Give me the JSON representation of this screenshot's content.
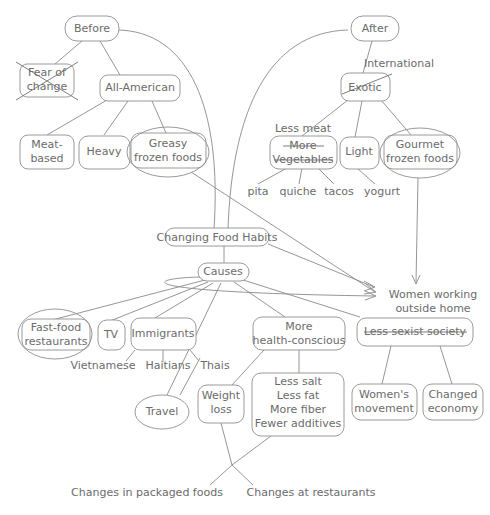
{
  "diagram": {
    "style": {
      "background": "#ffffff",
      "line_color": "#8a8a8a",
      "text_color": "#6b6b6b",
      "node_fill": "#ffffff",
      "node_stroke": "#8f8f8f"
    },
    "nodes": {
      "before": {
        "label": "Before",
        "shape": "rounded-rect"
      },
      "fear_of_change": {
        "label_line1": "Fear of",
        "label_line2": "change",
        "shape": "rounded-rect",
        "annotation": "crossed-out"
      },
      "all_american": {
        "label": "All-American",
        "shape": "rounded-rect"
      },
      "meat_based": {
        "label_line1": "Meat-",
        "label_line2": "based",
        "shape": "rounded-rect"
      },
      "heavy": {
        "label": "Heavy",
        "shape": "rounded-rect"
      },
      "greasy_frozen_foods": {
        "label_line1": "Greasy",
        "label_line2": "frozen foods",
        "shape": "rounded-rect",
        "annotation": "circled"
      },
      "after": {
        "label": "After",
        "shape": "rounded-rect"
      },
      "international": {
        "label": "International",
        "shape": "plain-text",
        "annotation": "replacement-label"
      },
      "exotic": {
        "label": "Exotic",
        "shape": "rounded-rect",
        "annotation": "struck-through"
      },
      "less_meat": {
        "label": "Less meat",
        "shape": "plain-text",
        "annotation": "replacement-label"
      },
      "more_vegetables": {
        "label_line1": "More",
        "label_line2": "Vegetables",
        "shape": "rounded-rect",
        "annotation": "struck-through"
      },
      "light": {
        "label": "Light",
        "shape": "rounded-rect"
      },
      "gourmet_frozen_foods": {
        "label_line1": "Gourmet",
        "label_line2": "frozen foods",
        "shape": "rounded-rect",
        "annotation": "circled"
      },
      "pita": {
        "label": "pita",
        "shape": "plain-text"
      },
      "quiche": {
        "label": "quiche",
        "shape": "plain-text"
      },
      "tacos": {
        "label": "tacos",
        "shape": "plain-text"
      },
      "yogurt": {
        "label": "yogurt",
        "shape": "plain-text"
      },
      "changing_food_habits": {
        "label": "Changing Food Habits",
        "shape": "rounded-rect"
      },
      "causes": {
        "label": "Causes",
        "shape": "rounded-rect"
      },
      "women_working": {
        "label_line1": "Women working",
        "label_line2": "outside home",
        "shape": "plain-text"
      },
      "fast_food_restaurants": {
        "label_line1": "Fast-food",
        "label_line2": "restaurants",
        "shape": "rounded-rect",
        "annotation": "circled"
      },
      "tv": {
        "label": "TV",
        "shape": "rounded-rect"
      },
      "immigrants": {
        "label": "Immigrants",
        "shape": "rounded-rect"
      },
      "more_health_conscious": {
        "label_line1": "More",
        "label_line2": "health-conscious",
        "shape": "rounded-rect"
      },
      "less_sexist_society": {
        "label": "Less sexist society",
        "shape": "rounded-rect",
        "annotation": "struck-through"
      },
      "vietnamese": {
        "label": "Vietnamese",
        "shape": "plain-text"
      },
      "haitians": {
        "label": "Haitians",
        "shape": "plain-text"
      },
      "thais": {
        "label": "Thais",
        "shape": "plain-text"
      },
      "travel": {
        "label": "Travel",
        "shape": "ellipse"
      },
      "weight_loss": {
        "label_line1": "Weight",
        "label_line2": "loss",
        "shape": "rounded-rect"
      },
      "health_details": {
        "label_line1": "Less salt",
        "label_line2": "Less fat",
        "label_line3": "More fiber",
        "label_line4": "Fewer additives",
        "shape": "rounded-rect"
      },
      "womens_movement": {
        "label_line1": "Women's",
        "label_line2": "movement",
        "shape": "rounded-rect"
      },
      "changed_economy": {
        "label_line1": "Changed",
        "label_line2": "economy",
        "shape": "rounded-rect"
      },
      "changes_packaged_foods": {
        "label": "Changes in packaged foods",
        "shape": "plain-text"
      },
      "changes_at_restaurants": {
        "label": "Changes at restaurants",
        "shape": "plain-text"
      }
    },
    "edges": [
      {
        "from": "before",
        "to": "fear_of_change"
      },
      {
        "from": "before",
        "to": "all_american"
      },
      {
        "from": "before",
        "to": "changing_food_habits"
      },
      {
        "from": "all_american",
        "to": "meat_based"
      },
      {
        "from": "all_american",
        "to": "heavy"
      },
      {
        "from": "all_american",
        "to": "greasy_frozen_foods"
      },
      {
        "from": "after",
        "to": "exotic"
      },
      {
        "from": "after",
        "to": "changing_food_habits"
      },
      {
        "from": "exotic",
        "to": "more_vegetables"
      },
      {
        "from": "exotic",
        "to": "light"
      },
      {
        "from": "exotic",
        "to": "gourmet_frozen_foods"
      },
      {
        "from": "more_vegetables",
        "to": "pita"
      },
      {
        "from": "more_vegetables",
        "to": "quiche"
      },
      {
        "from": "more_vegetables",
        "to": "tacos"
      },
      {
        "from": "light",
        "to": "yogurt"
      },
      {
        "from": "greasy_frozen_foods",
        "to": "women_working",
        "arrow": true
      },
      {
        "from": "gourmet_frozen_foods",
        "to": "women_working",
        "arrow": true
      },
      {
        "from": "changing_food_habits",
        "to": "causes"
      },
      {
        "from": "changing_food_habits",
        "to": "women_working",
        "arrow": true
      },
      {
        "from": "causes",
        "to": "fast_food_restaurants"
      },
      {
        "from": "causes",
        "to": "tv"
      },
      {
        "from": "causes",
        "to": "immigrants"
      },
      {
        "from": "causes",
        "to": "travel"
      },
      {
        "from": "causes",
        "to": "more_health_conscious"
      },
      {
        "from": "causes",
        "to": "less_sexist_society"
      },
      {
        "from": "causes",
        "to": "women_working",
        "arrow": true
      },
      {
        "from": "immigrants",
        "to": "vietnamese"
      },
      {
        "from": "immigrants",
        "to": "haitians"
      },
      {
        "from": "immigrants",
        "to": "thais"
      },
      {
        "from": "more_health_conscious",
        "to": "weight_loss"
      },
      {
        "from": "more_health_conscious",
        "to": "health_details"
      },
      {
        "from": "less_sexist_society",
        "to": "womens_movement"
      },
      {
        "from": "less_sexist_society",
        "to": "changed_economy"
      },
      {
        "from": "weight_loss",
        "to": "changes_packaged_foods"
      },
      {
        "from": "health_details",
        "to": "changes_at_restaurants"
      }
    ]
  }
}
